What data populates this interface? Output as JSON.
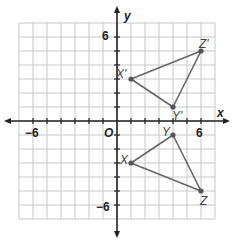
{
  "diagram": {
    "type": "coordinate-plane",
    "axes": {
      "x_label": "x",
      "y_label": "y",
      "origin_label": "O",
      "range": [
        -7,
        7
      ],
      "tick_labels": {
        "x_neg": "−6",
        "x_pos": "6",
        "y_pos": "6",
        "y_neg": "−6"
      }
    },
    "colors": {
      "grid": "#c8c8c8",
      "axis": "#222222",
      "triangle": "#666666",
      "point": "#555555"
    },
    "triangles": [
      {
        "name": "XYZ",
        "points": [
          {
            "label": "X",
            "x": 1,
            "y": -3
          },
          {
            "label": "Y",
            "x": 4,
            "y": -1
          },
          {
            "label": "Z",
            "x": 6,
            "y": -5
          }
        ]
      },
      {
        "name": "X'Y'Z'",
        "points": [
          {
            "label": "X'",
            "x": 1,
            "y": 3
          },
          {
            "label": "Y'",
            "x": 4,
            "y": 1
          },
          {
            "label": "Z'",
            "x": 6,
            "y": 5
          }
        ]
      }
    ]
  }
}
